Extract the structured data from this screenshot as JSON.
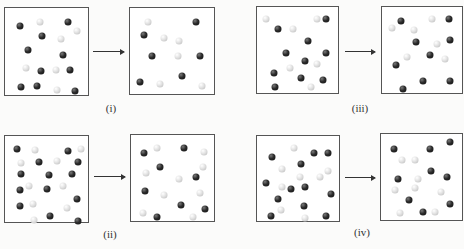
{
  "panels": [
    {
      "id": "i",
      "label": "(i)",
      "label_pos": [
        111,
        102
      ],
      "arrow": {
        "x": 93,
        "y": 51,
        "w": 31
      },
      "before": {
        "box": [
          4,
          7,
          85,
          89
        ],
        "balls": [
          [
            "d",
            14,
            17
          ],
          [
            "l",
            40,
            12
          ],
          [
            "d",
            76,
            12
          ],
          [
            "l",
            88,
            23
          ],
          [
            "d",
            43,
            30
          ],
          [
            "l",
            68,
            33
          ],
          [
            "d",
            25,
            47
          ],
          [
            "d",
            70,
            53
          ],
          [
            "l",
            22,
            69
          ],
          [
            "d",
            41,
            73
          ],
          [
            "l",
            61,
            71
          ],
          [
            "d",
            79,
            71
          ],
          [
            "d",
            16,
            92
          ],
          [
            "d",
            37,
            91
          ],
          [
            "l",
            62,
            96
          ],
          [
            "d",
            86,
            98
          ]
        ]
      },
      "after": {
        "box": [
          129,
          7,
          86,
          88
        ],
        "balls": [
          [
            "l",
            18,
            12
          ],
          [
            "d",
            80,
            12
          ],
          [
            "d",
            13,
            29
          ],
          [
            "l",
            38,
            32
          ],
          [
            "l",
            58,
            36
          ],
          [
            "d",
            23,
            55
          ],
          [
            "l",
            56,
            55
          ],
          [
            "d",
            84,
            55
          ],
          [
            "d",
            8,
            87
          ],
          [
            "l",
            33,
            90
          ],
          [
            "d",
            61,
            80
          ],
          [
            "l",
            87,
            93
          ]
        ]
      }
    },
    {
      "id": "iii",
      "label": "(iii)",
      "label_pos": [
        360,
        102
      ],
      "arrow": {
        "x": 345,
        "y": 51,
        "w": 30
      },
      "before": {
        "box": [
          256,
          6,
          83,
          88
        ],
        "balls": [
          [
            "l",
            7,
            10
          ],
          [
            "l",
            75,
            10
          ],
          [
            "d",
            87,
            10
          ],
          [
            "d",
            22,
            22
          ],
          [
            "l",
            43,
            22
          ],
          [
            "d",
            63,
            37
          ],
          [
            "d",
            33,
            52
          ],
          [
            "d",
            86,
            52
          ],
          [
            "d",
            58,
            62
          ],
          [
            "l",
            74,
            66
          ],
          [
            "l",
            38,
            71
          ],
          [
            "d",
            17,
            77
          ],
          [
            "d",
            53,
            84
          ],
          [
            "d",
            82,
            86
          ],
          [
            "d",
            18,
            95
          ],
          [
            "l",
            67,
            95
          ]
        ]
      },
      "after": {
        "box": [
          381,
          6,
          82,
          88
        ],
        "balls": [
          [
            "d",
            20,
            12
          ],
          [
            "l",
            62,
            10
          ],
          [
            "d",
            85,
            10
          ],
          [
            "l",
            8,
            21
          ],
          [
            "l",
            38,
            24
          ],
          [
            "d",
            40,
            39
          ],
          [
            "l",
            69,
            41
          ],
          [
            "d",
            86,
            36
          ],
          [
            "l",
            29,
            58
          ],
          [
            "d",
            59,
            55
          ],
          [
            "l",
            80,
            60
          ],
          [
            "d",
            13,
            68
          ],
          [
            "d",
            50,
            87
          ],
          [
            "d",
            86,
            87
          ],
          [
            "d",
            23,
            97
          ]
        ]
      }
    },
    {
      "id": "ii",
      "label": "(ii)",
      "label_pos": [
        110,
        228
      ],
      "arrow": {
        "x": 94,
        "y": 176,
        "w": 31
      },
      "before": {
        "box": [
          4,
          135,
          85,
          88
        ],
        "balls": [
          [
            "d",
            10,
            11
          ],
          [
            "l",
            34,
            12
          ],
          [
            "d",
            77,
            14
          ],
          [
            "l",
            93,
            11
          ],
          [
            "l",
            16,
            29
          ],
          [
            "d",
            39,
            27
          ],
          [
            "l",
            62,
            26
          ],
          [
            "d",
            89,
            27
          ],
          [
            "d",
            15,
            43
          ],
          [
            "d",
            52,
            44
          ],
          [
            "d",
            82,
            43
          ],
          [
            "l",
            26,
            58
          ],
          [
            "l",
            70,
            57
          ],
          [
            "d",
            14,
            63
          ],
          [
            "d",
            49,
            61
          ],
          [
            "d",
            88,
            74
          ],
          [
            "d",
            14,
            82
          ],
          [
            "l",
            31,
            80
          ],
          [
            "l",
            75,
            85
          ],
          [
            "d",
            53,
            95
          ],
          [
            "l",
            32,
            100
          ],
          [
            "d",
            89,
            101
          ]
        ]
      },
      "after": {
        "box": [
          130,
          134,
          85,
          88
        ],
        "balls": [
          [
            "d",
            12,
            17
          ],
          [
            "l",
            28,
            11
          ],
          [
            "d",
            64,
            11
          ],
          [
            "l",
            90,
            16
          ],
          [
            "d",
            33,
            35
          ],
          [
            "l",
            14,
            43
          ],
          [
            "l",
            88,
            35
          ],
          [
            "l",
            57,
            50
          ],
          [
            "d",
            79,
            48
          ],
          [
            "d",
            13,
            65
          ],
          [
            "l",
            38,
            70
          ],
          [
            "l",
            84,
            68
          ],
          [
            "d",
            60,
            83
          ],
          [
            "d",
            91,
            88
          ],
          [
            "l",
            11,
            92
          ],
          [
            "d",
            29,
            98
          ],
          [
            "l",
            75,
            98
          ]
        ]
      }
    },
    {
      "id": "iv",
      "label": "(iv)",
      "label_pos": [
        362,
        226
      ],
      "arrow": {
        "x": 345,
        "y": 177,
        "w": 30
      },
      "before": {
        "box": [
          256,
          135,
          84,
          87
        ],
        "balls": [
          [
            "l",
            43,
            10
          ],
          [
            "d",
            70,
            16
          ],
          [
            "d",
            88,
            16
          ],
          [
            "d",
            14,
            22
          ],
          [
            "d",
            52,
            31
          ],
          [
            "l",
            28,
            37
          ],
          [
            "l",
            88,
            39
          ],
          [
            "l",
            51,
            47
          ],
          [
            "l",
            77,
            47
          ],
          [
            "d",
            6,
            55
          ],
          [
            "l",
            28,
            59
          ],
          [
            "d",
            40,
            62
          ],
          [
            "d",
            58,
            59
          ],
          [
            "d",
            92,
            68
          ],
          [
            "d",
            22,
            75
          ],
          [
            "d",
            57,
            83
          ],
          [
            "l",
            26,
            88
          ],
          [
            "d",
            13,
            96
          ],
          [
            "l",
            58,
            99
          ],
          [
            "d",
            86,
            96
          ]
        ]
      },
      "after": {
        "box": [
          380,
          133,
          83,
          88
        ],
        "balls": [
          [
            "d",
            12,
            14
          ],
          [
            "d",
            60,
            14
          ],
          [
            "d",
            86,
            5
          ],
          [
            "l",
            23,
            28
          ],
          [
            "l",
            40,
            28
          ],
          [
            "d",
            61,
            41
          ],
          [
            "d",
            17,
            51
          ],
          [
            "l",
            44,
            51
          ],
          [
            "d",
            83,
            49
          ],
          [
            "l",
            13,
            65
          ],
          [
            "l",
            40,
            62
          ],
          [
            "l",
            75,
            67
          ],
          [
            "d",
            32,
            78
          ],
          [
            "d",
            87,
            83
          ],
          [
            "l",
            20,
            94
          ],
          [
            "d",
            50,
            93
          ],
          [
            "l",
            66,
            93
          ]
        ]
      }
    }
  ],
  "legend": {
    "dark": "dark-sphere",
    "light": "light-sphere"
  }
}
